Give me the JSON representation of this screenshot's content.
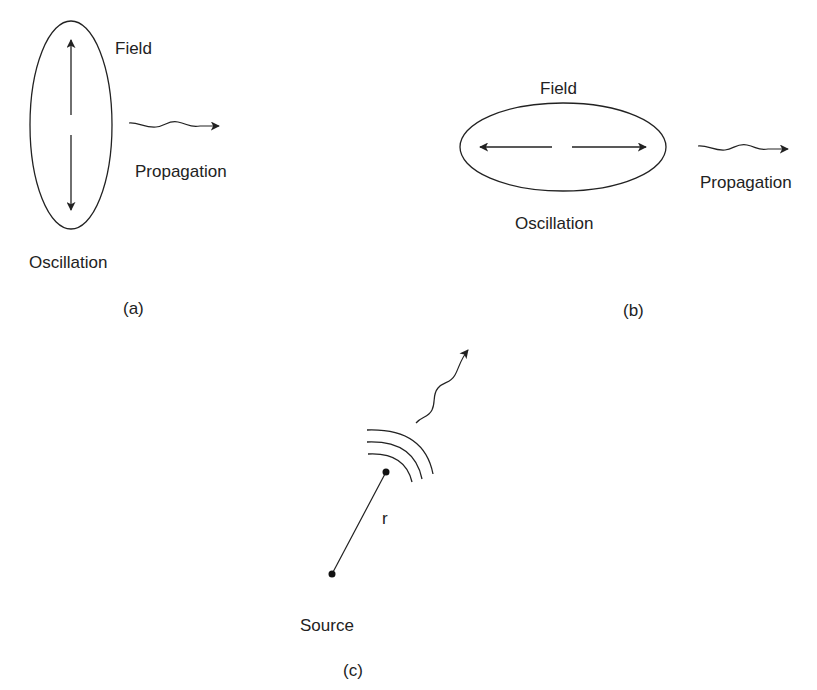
{
  "figure": {
    "ink_color": "#222222",
    "background": "#ffffff",
    "panels": [
      {
        "id": "a",
        "caption": "(a)",
        "field_label": "Field",
        "propagation_label": "Propagation",
        "oscillation_label": "Oscillation",
        "field_orientation": "vertical"
      },
      {
        "id": "b",
        "caption": "(b)",
        "field_label": "Field",
        "propagation_label": "Propagation",
        "oscillation_label": "Oscillation",
        "field_orientation": "horizontal"
      },
      {
        "id": "c",
        "caption": "(c)",
        "source_label": "Source",
        "distance_label": "r"
      }
    ]
  }
}
